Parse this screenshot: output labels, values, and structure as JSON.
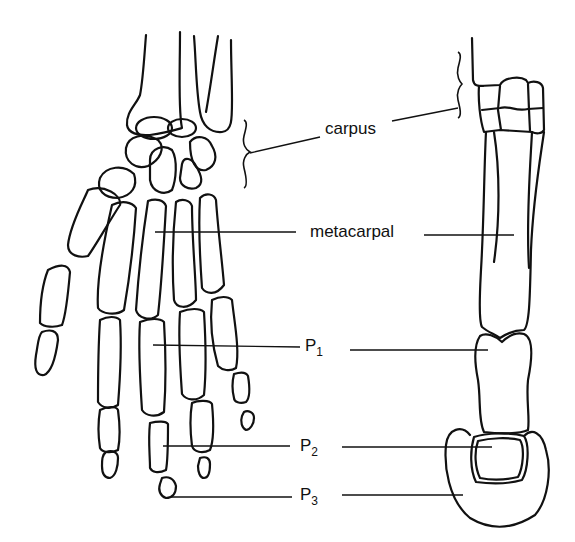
{
  "figure": {
    "left_panel": "human-hand-skeleton",
    "right_panel": "horse-forelimb-skeleton"
  },
  "labels": {
    "carpus": "carpus",
    "metacarpal": "metacarpal",
    "p1_main": "P",
    "p1_sub": "1",
    "p2_main": "P",
    "p2_sub": "2",
    "p3_main": "P",
    "p3_sub": "3"
  },
  "colors": {
    "line": "#111111",
    "background": "#ffffff"
  }
}
